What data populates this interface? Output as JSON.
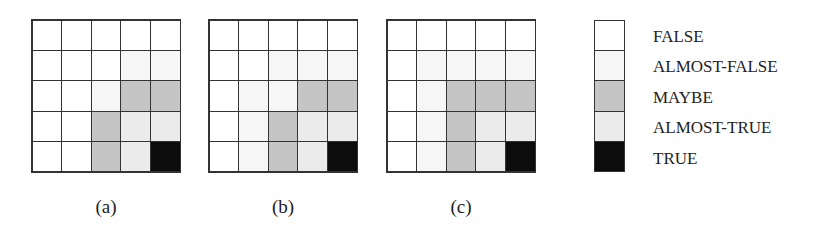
{
  "figure": {
    "panels": [
      {
        "id": "a",
        "caption": "(a)",
        "cells": [
          [
            "FALSE",
            "FALSE",
            "FALSE",
            "FALSE",
            "FALSE"
          ],
          [
            "FALSE",
            "FALSE",
            "FALSE",
            "ALMOST-FALSE",
            "ALMOST-FALSE"
          ],
          [
            "FALSE",
            "FALSE",
            "ALMOST-FALSE",
            "MAYBE",
            "MAYBE"
          ],
          [
            "FALSE",
            "FALSE",
            "MAYBE",
            "ALMOST-TRUE",
            "ALMOST-TRUE"
          ],
          [
            "FALSE",
            "FALSE",
            "MAYBE",
            "ALMOST-TRUE",
            "TRUE"
          ]
        ]
      },
      {
        "id": "b",
        "caption": "(b)",
        "cells": [
          [
            "FALSE",
            "FALSE",
            "FALSE",
            "FALSE",
            "FALSE"
          ],
          [
            "FALSE",
            "FALSE",
            "ALMOST-FALSE",
            "ALMOST-FALSE",
            "ALMOST-FALSE"
          ],
          [
            "FALSE",
            "ALMOST-FALSE",
            "ALMOST-FALSE",
            "MAYBE",
            "MAYBE"
          ],
          [
            "FALSE",
            "ALMOST-FALSE",
            "MAYBE",
            "ALMOST-TRUE",
            "ALMOST-TRUE"
          ],
          [
            "FALSE",
            "ALMOST-FALSE",
            "MAYBE",
            "ALMOST-TRUE",
            "TRUE"
          ]
        ]
      },
      {
        "id": "c",
        "caption": "(c)",
        "cells": [
          [
            "FALSE",
            "FALSE",
            "FALSE",
            "FALSE",
            "FALSE"
          ],
          [
            "FALSE",
            "ALMOST-FALSE",
            "ALMOST-FALSE",
            "ALMOST-FALSE",
            "ALMOST-FALSE"
          ],
          [
            "FALSE",
            "ALMOST-FALSE",
            "MAYBE",
            "MAYBE",
            "MAYBE"
          ],
          [
            "FALSE",
            "ALMOST-FALSE",
            "MAYBE",
            "ALMOST-TRUE",
            "ALMOST-TRUE"
          ],
          [
            "FALSE",
            "ALMOST-FALSE",
            "MAYBE",
            "ALMOST-TRUE",
            "TRUE"
          ]
        ]
      }
    ],
    "legend": [
      {
        "label": "FALSE",
        "color": "#ffffff"
      },
      {
        "label": "ALMOST-FALSE",
        "color": "#f6f6f6"
      },
      {
        "label": "MAYBE",
        "color": "#c5c5c5"
      },
      {
        "label": "ALMOST-TRUE",
        "color": "#ebebeb"
      },
      {
        "label": "TRUE",
        "color": "#0c0c0c"
      }
    ]
  }
}
